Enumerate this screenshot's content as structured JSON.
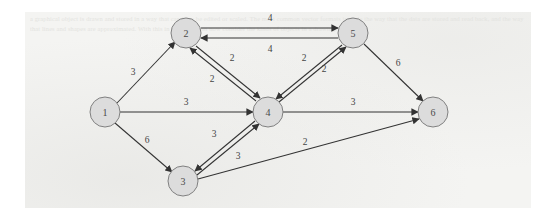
{
  "figure": {
    "type": "directed-weighted-graph",
    "background_color": "#f4f4f2",
    "node_fill": "#dcdcdc",
    "node_stroke": "#808080",
    "edge_color": "#333333",
    "bleed_through_text": "a graphical object is drawn and stored in a way that can later be edited or scaled. The most common vector formats include the way that the data are stored and read back, and the way that lines and shapes are approximated. With this in mind, we can now consider the kinds of objects in a drawing."
  },
  "nodes": [
    {
      "id": "1",
      "label": "1",
      "cx": 105,
      "cy": 112,
      "r": 15
    },
    {
      "id": "2",
      "label": "2",
      "cx": 186,
      "cy": 33,
      "r": 15
    },
    {
      "id": "3",
      "label": "3",
      "cx": 183,
      "cy": 181,
      "r": 15
    },
    {
      "id": "4",
      "label": "4",
      "cx": 268,
      "cy": 112,
      "r": 15
    },
    {
      "id": "5",
      "label": "5",
      "cx": 353,
      "cy": 33,
      "r": 15
    },
    {
      "id": "6",
      "label": "6",
      "cx": 433,
      "cy": 112,
      "r": 15
    }
  ],
  "edges": [
    {
      "id": "e-1-2",
      "from": "1",
      "to": "2",
      "weight": "3",
      "x1": 117,
      "y1": 103,
      "x2": 175,
      "y2": 42,
      "lx": 133,
      "ly": 72
    },
    {
      "id": "e-1-4",
      "from": "1",
      "to": "4",
      "weight": "3",
      "x1": 120,
      "y1": 112,
      "x2": 253,
      "y2": 112,
      "lx": 186,
      "ly": 102
    },
    {
      "id": "e-1-3",
      "from": "1",
      "to": "3",
      "weight": "6",
      "x1": 115,
      "y1": 123,
      "x2": 172,
      "y2": 172,
      "lx": 147,
      "ly": 140
    },
    {
      "id": "e-2-5",
      "from": "2",
      "to": "5",
      "weight": "4",
      "x1": 201,
      "y1": 28,
      "x2": 338,
      "y2": 28,
      "lx": 270,
      "ly": 18
    },
    {
      "id": "e-5-2",
      "from": "5",
      "to": "2",
      "weight": "4",
      "x1": 338,
      "y1": 38,
      "x2": 201,
      "y2": 38,
      "lx": 270,
      "ly": 49
    },
    {
      "id": "e-2-4",
      "from": "2",
      "to": "4",
      "weight": "2",
      "x1": 196,
      "y1": 46,
      "x2": 260,
      "y2": 98,
      "lx": 232,
      "ly": 58
    },
    {
      "id": "e-4-2",
      "from": "4",
      "to": "2",
      "weight": "2",
      "x1": 256,
      "y1": 101,
      "x2": 190,
      "y2": 48,
      "lx": 212,
      "ly": 79
    },
    {
      "id": "e-4-5",
      "from": "4",
      "to": "5",
      "weight": "2",
      "x1": 279,
      "y1": 102,
      "x2": 346,
      "y2": 47,
      "lx": 324,
      "ly": 69
    },
    {
      "id": "e-5-4",
      "from": "5",
      "to": "4",
      "weight": "2",
      "x1": 342,
      "y1": 45,
      "x2": 276,
      "y2": 99,
      "lx": 304,
      "ly": 58
    },
    {
      "id": "e-5-6",
      "from": "5",
      "to": "6",
      "weight": "6",
      "x1": 364,
      "y1": 44,
      "x2": 423,
      "y2": 101,
      "lx": 398,
      "ly": 63
    },
    {
      "id": "e-4-6",
      "from": "4",
      "to": "6",
      "weight": "3",
      "x1": 283,
      "y1": 112,
      "x2": 418,
      "y2": 112,
      "lx": 353,
      "ly": 102
    },
    {
      "id": "e-4-3",
      "from": "4",
      "to": "3",
      "weight": "3",
      "x1": 255,
      "y1": 121,
      "x2": 195,
      "y2": 171,
      "lx": 214,
      "ly": 134
    },
    {
      "id": "e-3-4",
      "from": "3",
      "to": "4",
      "weight": "3",
      "x1": 197,
      "y1": 175,
      "x2": 259,
      "y2": 124,
      "lx": 238,
      "ly": 156
    },
    {
      "id": "e-3-6",
      "from": "3",
      "to": "6",
      "weight": "2",
      "x1": 198,
      "y1": 179,
      "x2": 419,
      "y2": 119,
      "lx": 305,
      "ly": 142
    }
  ]
}
